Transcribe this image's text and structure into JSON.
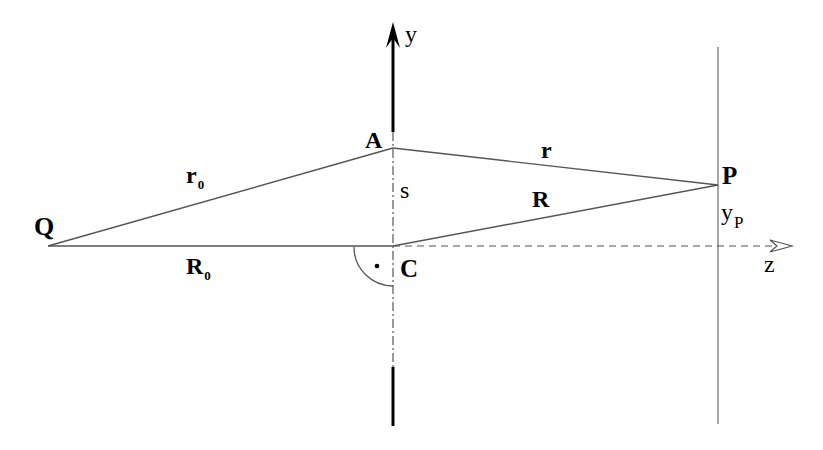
{
  "diagram": {
    "points": {
      "Q": {
        "label": "Q",
        "x": 48,
        "y": 246
      },
      "A": {
        "label": "A",
        "x": 393,
        "y": 148
      },
      "C": {
        "label": "C",
        "x": 393,
        "y": 246
      },
      "P": {
        "label": "P",
        "x": 718,
        "y": 185
      }
    },
    "segments": {
      "r0": {
        "label": "r",
        "subscript": "0",
        "from": "Q",
        "to": "A"
      },
      "R0": {
        "label": "R",
        "subscript": "0",
        "from": "Q",
        "to": "C"
      },
      "r": {
        "label": "r",
        "from": "A",
        "to": "P"
      },
      "R": {
        "label": "R",
        "from": "C",
        "to": "P"
      },
      "s": {
        "label": "s",
        "from": "C",
        "to": "A"
      }
    },
    "axes": {
      "y": {
        "label": "y"
      },
      "z": {
        "label": "z"
      }
    },
    "screen_line": {
      "label": "y",
      "subscript": "P"
    },
    "right_angle_marker": {
      "at": "C"
    },
    "colors": {
      "ink": "#000000",
      "thin_line": "#555555"
    }
  }
}
